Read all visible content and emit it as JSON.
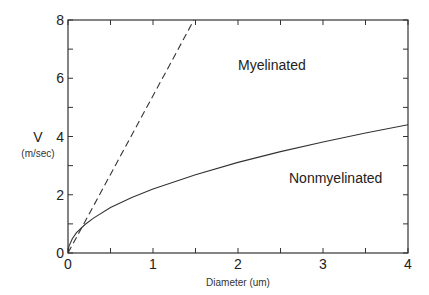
{
  "chart_data": {
    "type": "line",
    "title": "",
    "xlabel": "Diameter (um)",
    "ylabel": "V",
    "ylabel_units": "(m/sec)",
    "xlim": [
      0,
      4
    ],
    "ylim": [
      0,
      8
    ],
    "x_ticks": [
      0,
      1,
      2,
      3,
      4
    ],
    "x_minor_ticks": [
      0.5,
      1.5,
      2.5,
      3.5
    ],
    "y_ticks": [
      0,
      2,
      4,
      6,
      8
    ],
    "y_minor_ticks": [
      1,
      3,
      5,
      7
    ],
    "x_tick_labels": [
      "0",
      "1",
      "2",
      "3",
      "4"
    ],
    "y_tick_labels": [
      "0",
      "2",
      "4",
      "6",
      "8"
    ],
    "grid": false,
    "legend": null,
    "series": [
      {
        "name": "Myelinated",
        "style": "dashed",
        "x": [
          0,
          0.25,
          0.5,
          0.75,
          1.0,
          1.25,
          1.48
        ],
        "y": [
          0,
          1.35,
          2.7,
          4.05,
          5.4,
          6.75,
          8.0
        ]
      },
      {
        "name": "Nonmyelinated",
        "style": "solid",
        "x": [
          0,
          0.01,
          0.05,
          0.1,
          0.2,
          0.3,
          0.5,
          0.75,
          1.0,
          1.5,
          2.0,
          2.5,
          3.0,
          3.5,
          4.0
        ],
        "y": [
          0,
          0.22,
          0.49,
          0.7,
          0.98,
          1.2,
          1.56,
          1.91,
          2.2,
          2.69,
          3.11,
          3.48,
          3.81,
          4.12,
          4.4
        ]
      }
    ],
    "annotations": [
      {
        "text": "Myelinated",
        "x": 2.0,
        "y": 6.3
      },
      {
        "text": "Nonmyelinated",
        "x": 2.6,
        "y": 2.4
      }
    ]
  }
}
